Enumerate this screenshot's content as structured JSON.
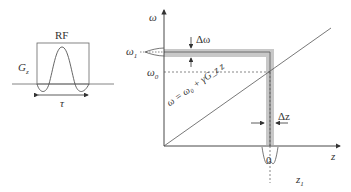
{
  "pulse_panel": {
    "rf_label": "RF",
    "gradient_label": "G",
    "gradient_subscript": "z",
    "duration_label": "τ"
  },
  "main_plot": {
    "y_axis_label": "ω",
    "x_axis_label": "z",
    "omega1_label": "ω",
    "omega1_sub": "1",
    "omega0_label": "ω",
    "omega0_sub": "0",
    "delta_omega_label": "Δω",
    "delta_z_label": "Δz",
    "zero_label": "0",
    "z1_label": "z",
    "z1_sub": "1",
    "equation": "ω = ω₀ + γG_z z"
  },
  "colors": {
    "line": "#444444",
    "band": "#c8c8c8",
    "dashed": "#555555"
  }
}
